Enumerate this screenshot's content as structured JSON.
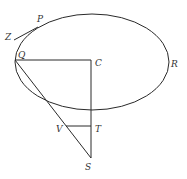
{
  "figure": {
    "type": "geometric-diagram",
    "colors": {
      "stroke": "#2a2a2a",
      "label": "#333333",
      "background": "#ffffff"
    },
    "labels": {
      "P": "P",
      "Z": "Z",
      "Q": "Q",
      "C": "C",
      "R": "R",
      "V": "V",
      "T": "T",
      "S": "S"
    }
  }
}
